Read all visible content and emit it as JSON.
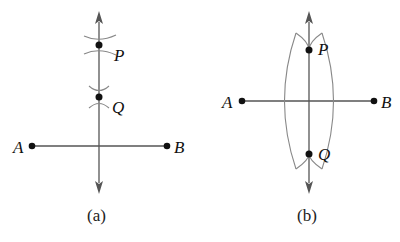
{
  "figure": {
    "colors": {
      "line": "#555555",
      "arc": "#888888",
      "point": "#111111",
      "background": "#ffffff"
    },
    "panels": [
      {
        "caption": "(a)",
        "description": "Perpendicular from P through Q to segment AB; arc pairs marking P and Q",
        "points": {
          "A": {
            "label": "A",
            "x": 32,
            "y": 146
          },
          "B": {
            "label": "B",
            "x": 167,
            "y": 146
          },
          "P": {
            "label": "P",
            "x": 99,
            "y": 45
          },
          "Q": {
            "label": "Q",
            "x": 99,
            "y": 97
          }
        }
      },
      {
        "caption": "(b)",
        "description": "Perpendicular bisector of AB through intersection points P and Q of two arcs",
        "points": {
          "A": {
            "label": "A",
            "x": 242,
            "y": 101
          },
          "B": {
            "label": "B",
            "x": 374,
            "y": 101
          },
          "P": {
            "label": "P",
            "x": 309,
            "y": 50
          },
          "Q": {
            "label": "Q",
            "x": 309,
            "y": 154
          }
        }
      }
    ]
  }
}
